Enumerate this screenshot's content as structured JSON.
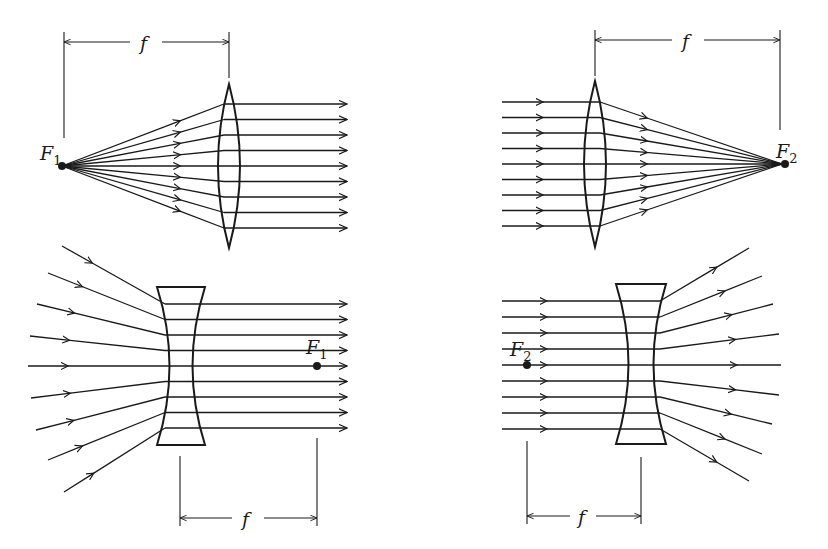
{
  "figure": {
    "background": "#ffffff",
    "ink": "#1a1a1a"
  },
  "panels": [
    {
      "id": "converging-f1",
      "lens": "converging",
      "focal_label": "F",
      "focal_sub": "1",
      "dimension_label": "f",
      "ray_count": 9,
      "description": "Rays diverge from F1 and exit the lens parallel"
    },
    {
      "id": "converging-f2",
      "lens": "converging",
      "focal_label": "F",
      "focal_sub": "2",
      "dimension_label": "f",
      "ray_count": 9,
      "description": "Parallel rays converge to F2 after the lens"
    },
    {
      "id": "diverging-f1",
      "lens": "diverging",
      "focal_label": "F",
      "focal_sub": "1",
      "dimension_label": "f",
      "ray_count": 9,
      "description": "Rays converging toward F1 exit the lens parallel"
    },
    {
      "id": "diverging-f2",
      "lens": "diverging",
      "focal_label": "F",
      "focal_sub": "2",
      "dimension_label": "f",
      "ray_count": 9,
      "description": "Parallel rays diverge as if from F2 after the lens"
    }
  ]
}
